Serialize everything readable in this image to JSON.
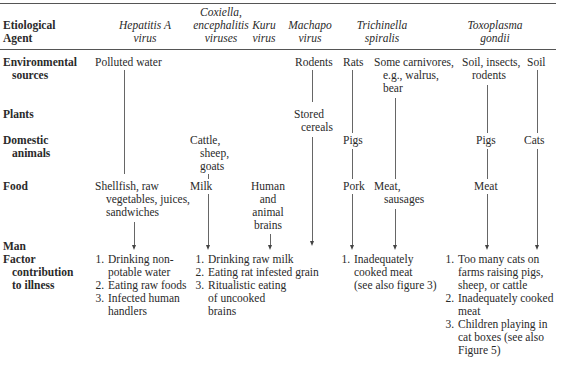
{
  "header": {
    "row_label": [
      "Etiological",
      "Agent"
    ],
    "agents": [
      {
        "lines": [
          "Hepatitis A",
          "virus"
        ]
      },
      {
        "lines": [
          "Coxiella,",
          "encephalitis",
          "viruses"
        ]
      },
      {
        "lines": [
          "Kuru",
          "virus"
        ]
      },
      {
        "lines": [
          "Machapo",
          "virus"
        ]
      },
      {
        "lines": [
          "Trichinella",
          "spiralis"
        ]
      },
      {
        "lines": [
          "Toxoplasma",
          "gondii"
        ]
      }
    ]
  },
  "rows": {
    "environmental": [
      "Environmental",
      "sources"
    ],
    "plants": [
      "Plants"
    ],
    "domestic": [
      "Domestic",
      "animals"
    ],
    "food": [
      "Food"
    ],
    "man": [
      "Man"
    ],
    "factor": [
      "Factor",
      "contribution",
      "to illness"
    ]
  },
  "cells": {
    "hepA_env": "Polluted water",
    "hepA_food": [
      "Shellfish, raw",
      "vegetables, juices,",
      "sandwiches"
    ],
    "cox_dom": [
      "Cattle,",
      "sheep,",
      "goats"
    ],
    "cox_food": "Milk",
    "kuru_food": [
      "Human",
      "and",
      "animal",
      "brains"
    ],
    "mach_env": "Rodents",
    "mach_plants": [
      "Stored",
      "cereals"
    ],
    "trich_env_a": "Rats",
    "trich_env_b": [
      "Some carnivores,",
      "e.g., walrus,",
      "bear"
    ],
    "trich_dom": "Pigs",
    "trich_food_a": "Pork",
    "trich_food_b": [
      "Meat,",
      "sausages"
    ],
    "toxo_env_a": [
      "Soil, insects,",
      "rodents"
    ],
    "toxo_env_b": "Soil",
    "toxo_dom_a": "Pigs",
    "toxo_dom_b": "Cats",
    "toxo_food": "Meat"
  },
  "factors": {
    "hepA": [
      {
        "n": "1.",
        "lines": [
          "Drinking non-",
          "potable water"
        ]
      },
      {
        "n": "2.",
        "lines": [
          "Eating raw foods"
        ]
      },
      {
        "n": "3.",
        "lines": [
          "Infected human",
          "handlers"
        ]
      }
    ],
    "middle": [
      {
        "n": "1.",
        "lines": [
          "Drinking raw milk"
        ]
      },
      {
        "n": "2.",
        "lines": [
          "Eating rat infested grain"
        ]
      },
      {
        "n": "3.",
        "lines": [
          "Ritualistic eating",
          "of uncooked",
          "brains"
        ]
      }
    ],
    "trich": [
      {
        "n": "1.",
        "lines": [
          "Inadequately",
          "cooked meat",
          "(see also figure 3)"
        ]
      }
    ],
    "toxo": [
      {
        "n": "1.",
        "lines": [
          "Too many cats on",
          "farms raising pigs,",
          "sheep, or cattle"
        ]
      },
      {
        "n": "2.",
        "lines": [
          "Inadequately cooked",
          "meat"
        ]
      },
      {
        "n": "3.",
        "lines": [
          "Children playing in",
          "cat boxes (see also",
          "Figure 5)"
        ]
      }
    ]
  }
}
